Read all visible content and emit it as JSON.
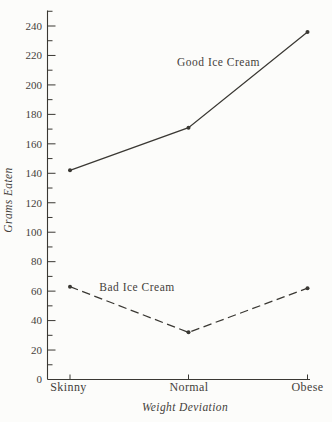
{
  "figure": {
    "background_color": "#fcfcfa",
    "ink_color": "#3a3833",
    "text_color": "#44413b"
  },
  "chart_data": {
    "type": "line",
    "title": "",
    "xlabel": "Weight Deviation",
    "ylabel": "Grams Eaten",
    "categories": [
      "Skinny",
      "Normal",
      "Obese"
    ],
    "series": [
      {
        "name": "Good Ice Cream",
        "line_style": "solid",
        "marker": "dot",
        "values": [
          142,
          171,
          236
        ]
      },
      {
        "name": "Bad Ice Cream",
        "line_style": "dashed",
        "marker": "dot",
        "values": [
          63,
          32,
          62
        ]
      }
    ],
    "ylim": [
      0,
      250
    ],
    "ytick_major_step": 20,
    "ytick_minor_step": 10,
    "ytick_label_max": 240,
    "grid": "off",
    "legend": "inline-labels-next-to-lines"
  }
}
